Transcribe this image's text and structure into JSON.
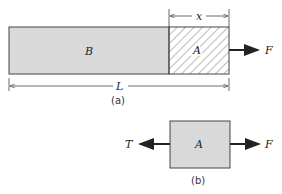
{
  "figure_a": {
    "caption": "(a)",
    "segment_b_label": "B",
    "segment_a_label": "A",
    "force_label": "F",
    "length_label": "L",
    "section_length_label": "x"
  },
  "figure_b": {
    "caption": "(b)",
    "body_label": "A",
    "left_force_label": "T",
    "right_force_label": "F"
  },
  "colors": {
    "fill": "#d9d9d9",
    "stroke": "#444444",
    "arrow": "#222222"
  }
}
